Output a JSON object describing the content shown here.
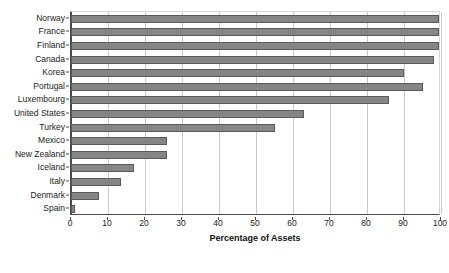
{
  "chart_data": {
    "type": "bar",
    "orientation": "horizontal",
    "title": "",
    "xlabel": "Percentage of Assets",
    "ylabel": "",
    "xlim": [
      0,
      100
    ],
    "xticks": [
      0,
      10,
      20,
      30,
      40,
      50,
      60,
      70,
      80,
      90,
      100
    ],
    "grid": true,
    "legend": false,
    "bar_color": "#858585",
    "bar_edge_color": "#5a5a5a",
    "categories": [
      "Norway",
      "France",
      "Finland",
      "Canada",
      "Korea",
      "Portugal",
      "Luxembourg",
      "United States",
      "Turkey",
      "Mexico",
      "New Zealand",
      "Iceland",
      "Italy",
      "Denmark",
      "Spain"
    ],
    "values": [
      100,
      100,
      100,
      98,
      90,
      95,
      86,
      63,
      55,
      26,
      26,
      17,
      13.5,
      7.5,
      1.2
    ]
  }
}
